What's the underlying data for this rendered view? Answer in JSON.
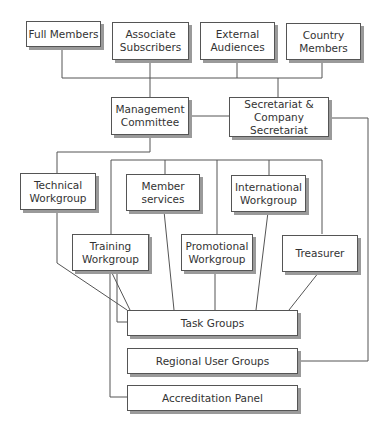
{
  "diagram": {
    "type": "organisational-chart",
    "nodes": {
      "full_members": "Full Members",
      "associate_subscribers": "Associate\nSubscribers",
      "external_audiences": "External\nAudiences",
      "country_members": "Country\nMembers",
      "management_committee": "Management\nCommittee",
      "secretariat": "Secretariat &\nCompany Secretariat",
      "technical_workgroup": "Technical\nWorkgroup",
      "member_services": "Member\nservices",
      "international_workgroup": "International\nWorkgroup",
      "training_workgroup": "Training\nWorkgroup",
      "promotional_workgroup": "Promotional\nWorkgroup",
      "treasurer": "Treasurer",
      "task_groups": "Task Groups",
      "regional_user_groups": "Regional User Groups",
      "accreditation_panel": "Accreditation Panel"
    },
    "edges": [
      [
        "full_members",
        "management_committee"
      ],
      [
        "associate_subscribers",
        "management_committee"
      ],
      [
        "external_audiences",
        "secretariat"
      ],
      [
        "country_members",
        "secretariat"
      ],
      [
        "management_committee",
        "secretariat"
      ],
      [
        "management_committee",
        "technical_workgroup"
      ],
      [
        "management_committee",
        "member_services"
      ],
      [
        "management_committee",
        "international_workgroup"
      ],
      [
        "management_committee",
        "training_workgroup"
      ],
      [
        "management_committee",
        "promotional_workgroup"
      ],
      [
        "management_committee",
        "treasurer"
      ],
      [
        "technical_workgroup",
        "task_groups"
      ],
      [
        "training_workgroup",
        "task_groups"
      ],
      [
        "member_services",
        "task_groups"
      ],
      [
        "promotional_workgroup",
        "task_groups"
      ],
      [
        "international_workgroup",
        "task_groups"
      ],
      [
        "treasurer",
        "task_groups"
      ],
      [
        "secretariat",
        "regional_user_groups"
      ],
      [
        "training_workgroup",
        "accreditation_panel"
      ]
    ],
    "colors": {
      "line": "#555555",
      "box_border": "#555555",
      "box_shadow": "#9a9a9a",
      "text": "#333333",
      "background": "#ffffff"
    }
  }
}
